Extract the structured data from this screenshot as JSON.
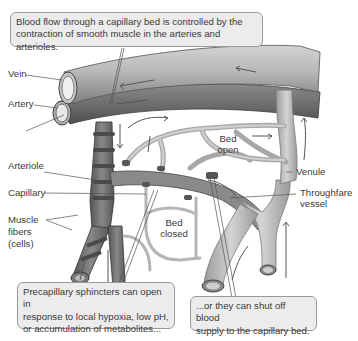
{
  "callouts": {
    "top": {
      "line1": "Blood flow through a capillary bed is controlled by the",
      "line2": "contraction of smooth muscle in the arteries and arterioles."
    },
    "bottom_left": {
      "line1": "Precapillary sphincters can open in",
      "line2": "response to local hypoxia, low pH,",
      "line3": "or accumulation of metabolites..."
    },
    "bottom_right": {
      "line1": "...or they can shut off blood",
      "line2": "supply to the capillary bed."
    }
  },
  "labels": {
    "vein": "Vein",
    "artery": "Artery",
    "arteriole": "Arteriole",
    "capillary": "Capillary",
    "muscle_fibers": [
      "Muscle",
      "fibers",
      "(cells)"
    ],
    "venule": "Venule",
    "thoroughfare": [
      "Throughfare",
      "vessel"
    ],
    "bed_open": [
      "Bed",
      "open"
    ],
    "bed_closed": [
      "Bed",
      "closed"
    ]
  },
  "colors": {
    "vessel_light": "#c8c8c8",
    "vessel_mid": "#9a9a9a",
    "vessel_dark": "#5a5a5a",
    "callout_bg": "#ececec",
    "callout_border": "#9a9a9a",
    "text": "#3a3a3a"
  }
}
